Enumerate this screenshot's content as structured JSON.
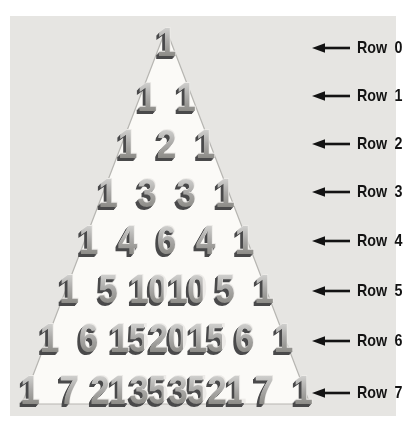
{
  "diagram": {
    "rows": [
      {
        "label": "Row 0",
        "values": [
          1
        ]
      },
      {
        "label": "Row 1",
        "values": [
          1,
          1
        ]
      },
      {
        "label": "Row 2",
        "values": [
          1,
          2,
          1
        ]
      },
      {
        "label": "Row 3",
        "values": [
          1,
          3,
          3,
          1
        ]
      },
      {
        "label": "Row 4",
        "values": [
          1,
          4,
          6,
          4,
          1
        ]
      },
      {
        "label": "Row 5",
        "values": [
          1,
          5,
          10,
          10,
          5,
          1
        ]
      },
      {
        "label": "Row 6",
        "values": [
          1,
          6,
          15,
          20,
          15,
          6,
          1
        ]
      },
      {
        "label": "Row 7",
        "values": [
          1,
          7,
          21,
          35,
          35,
          21,
          7,
          1
        ]
      }
    ]
  },
  "colors": {
    "page_bg": "#ffffff",
    "panel_bg": "#e6e5e2",
    "triangle_fill": "#fbfaf7",
    "triangle_stroke": "#b7b6b2",
    "digit_face_top": "#d4d4d2",
    "digit_face_bottom": "#85847f",
    "digit_extrude": "#49494a",
    "arrow_color": "#131313",
    "label_color": "#131313"
  }
}
